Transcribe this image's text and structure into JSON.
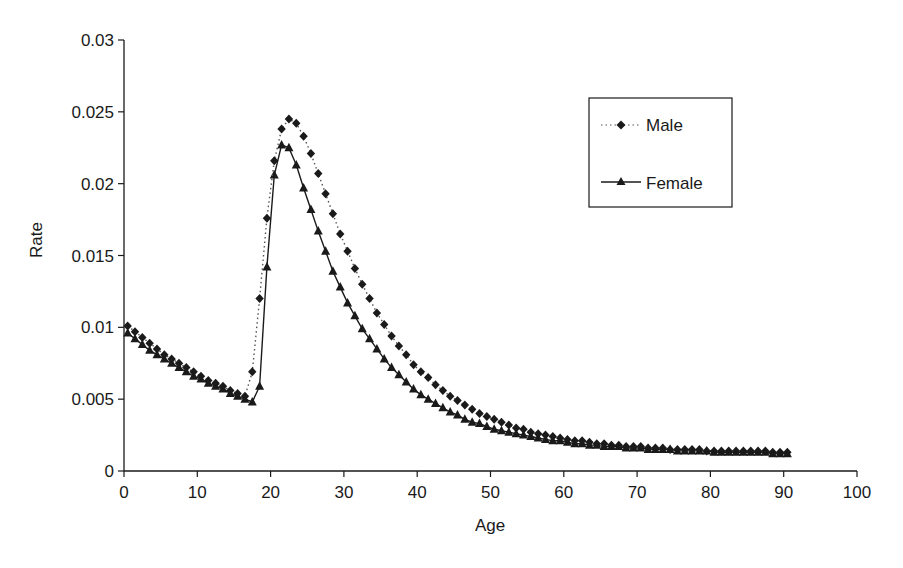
{
  "chart_data": {
    "type": "line",
    "title": "",
    "xlabel": "Age",
    "ylabel": "Rate",
    "xlim": [
      0,
      100
    ],
    "ylim": [
      0,
      0.03
    ],
    "x_ticks": [
      0,
      10,
      20,
      30,
      40,
      50,
      60,
      70,
      80,
      90,
      100
    ],
    "x_tick_labels": [
      "0",
      "10",
      "20",
      "30",
      "40",
      "50",
      "60",
      "70",
      "80",
      "90",
      "100"
    ],
    "y_ticks": [
      0,
      0.005,
      0.01,
      0.015,
      0.02,
      0.025,
      0.03
    ],
    "y_tick_labels": [
      "0",
      "0.005",
      "0.01",
      "0.015",
      "0.02",
      "0.025",
      "0.03"
    ],
    "grid": false,
    "legend_position": "upper right (inside plot)",
    "x": [
      0.5,
      1.5,
      2.5,
      3.5,
      4.5,
      5.5,
      6.5,
      7.5,
      8.5,
      9.5,
      10.5,
      11.5,
      12.5,
      13.5,
      14.5,
      15.5,
      16.5,
      17.5,
      18.5,
      19.5,
      20.5,
      21.5,
      22.5,
      23.5,
      24.5,
      25.5,
      26.5,
      27.5,
      28.5,
      29.5,
      30.5,
      31.5,
      32.5,
      33.5,
      34.5,
      35.5,
      36.5,
      37.5,
      38.5,
      39.5,
      40.5,
      41.5,
      42.5,
      43.5,
      44.5,
      45.5,
      46.5,
      47.5,
      48.5,
      49.5,
      50.5,
      51.5,
      52.5,
      53.5,
      54.5,
      55.5,
      56.5,
      57.5,
      58.5,
      59.5,
      60.5,
      61.5,
      62.5,
      63.5,
      64.5,
      65.5,
      66.5,
      67.5,
      68.5,
      69.5,
      70.5,
      71.5,
      72.5,
      73.5,
      74.5,
      75.5,
      76.5,
      77.5,
      78.5,
      79.5,
      80.5,
      81.5,
      82.5,
      83.5,
      84.5,
      85.5,
      86.5,
      87.5,
      88.5,
      89.5,
      90.5
    ],
    "series": [
      {
        "name": "Male",
        "line_style": "dotted",
        "marker": "diamond",
        "color": "#1a1a1a",
        "values": [
          0.0101,
          0.0097,
          0.0093,
          0.0089,
          0.0085,
          0.0081,
          0.0078,
          0.0075,
          0.0072,
          0.0069,
          0.0066,
          0.0063,
          0.0061,
          0.0059,
          0.0056,
          0.0054,
          0.0052,
          0.0069,
          0.012,
          0.0176,
          0.0216,
          0.0238,
          0.0245,
          0.0242,
          0.0233,
          0.0221,
          0.0207,
          0.0193,
          0.0179,
          0.0165,
          0.0153,
          0.0141,
          0.013,
          0.012,
          0.011,
          0.0102,
          0.0094,
          0.0087,
          0.0081,
          0.0074,
          0.0069,
          0.0065,
          0.006,
          0.0056,
          0.0052,
          0.0049,
          0.0046,
          0.0043,
          0.004,
          0.0038,
          0.0036,
          0.0034,
          0.0032,
          0.003,
          0.0029,
          0.0027,
          0.0026,
          0.0025,
          0.0024,
          0.0023,
          0.0022,
          0.0021,
          0.0021,
          0.002,
          0.0019,
          0.0019,
          0.0018,
          0.0018,
          0.0017,
          0.0017,
          0.0017,
          0.0016,
          0.0016,
          0.0016,
          0.0015,
          0.0015,
          0.0015,
          0.0015,
          0.0015,
          0.0014,
          0.0014,
          0.0014,
          0.0014,
          0.0014,
          0.0014,
          0.0014,
          0.0014,
          0.0014,
          0.0013,
          0.0013,
          0.0013
        ]
      },
      {
        "name": "Female",
        "line_style": "solid",
        "marker": "triangle",
        "color": "#1a1a1a",
        "values": [
          0.0096,
          0.0092,
          0.0088,
          0.0084,
          0.0081,
          0.0078,
          0.0075,
          0.0072,
          0.0069,
          0.0066,
          0.0064,
          0.0061,
          0.0059,
          0.0057,
          0.0054,
          0.0052,
          0.005,
          0.0048,
          0.0059,
          0.0142,
          0.0206,
          0.0227,
          0.0225,
          0.0213,
          0.0197,
          0.0182,
          0.0167,
          0.0153,
          0.0139,
          0.0128,
          0.0117,
          0.0108,
          0.0099,
          0.0092,
          0.0085,
          0.0078,
          0.0072,
          0.0067,
          0.0062,
          0.0057,
          0.0053,
          0.005,
          0.0047,
          0.0044,
          0.0041,
          0.0039,
          0.0036,
          0.0034,
          0.0033,
          0.0031,
          0.0029,
          0.0028,
          0.0027,
          0.0026,
          0.0025,
          0.0024,
          0.0023,
          0.0022,
          0.0021,
          0.0021,
          0.002,
          0.0019,
          0.0019,
          0.0018,
          0.0018,
          0.0017,
          0.0017,
          0.0017,
          0.0016,
          0.0016,
          0.0016,
          0.0015,
          0.0015,
          0.0015,
          0.0015,
          0.0014,
          0.0014,
          0.0014,
          0.0014,
          0.0014,
          0.0013,
          0.0013,
          0.0013,
          0.0013,
          0.0013,
          0.0013,
          0.0013,
          0.0013,
          0.0012,
          0.0012,
          0.0012
        ]
      }
    ]
  },
  "legend": {
    "male_label": "Male",
    "female_label": "Female"
  },
  "axes": {
    "x_title": "Age",
    "y_title": "Rate"
  }
}
